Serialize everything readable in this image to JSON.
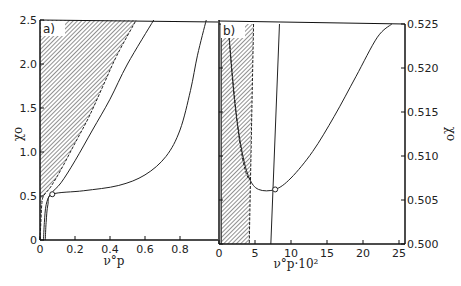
{
  "chart_data": [
    {
      "panel": "a)",
      "type": "line",
      "xlabel": "ν°p",
      "ylabel": "χo",
      "xlim": [
        0,
        1.0
      ],
      "ylim": [
        0,
        2.5
      ],
      "xticks": [
        0,
        0.2,
        0.4,
        0.6,
        0.8
      ],
      "xtick_labels": [
        "0",
        "0.2",
        "0.4",
        "0.6",
        "0.8"
      ],
      "yticks": [
        0,
        0.5,
        1.0,
        1.5,
        2.0,
        2.5
      ],
      "ytick_labels": [
        "0",
        "0.5",
        "1.0",
        "1.5",
        "2.0",
        "2.5"
      ],
      "grid": false,
      "shaded_region": {
        "description": "hatched region left of dashed boundary",
        "boundary": [
          [
            0.0,
            0.0
          ],
          [
            0.005,
            0.2
          ],
          [
            0.01,
            0.4
          ],
          [
            0.02,
            0.5
          ],
          [
            0.06,
            0.6
          ],
          [
            0.12,
            0.8
          ],
          [
            0.2,
            1.1
          ],
          [
            0.28,
            1.4
          ],
          [
            0.36,
            1.75
          ],
          [
            0.44,
            2.1
          ],
          [
            0.55,
            2.5
          ]
        ]
      },
      "series": [
        {
          "name": "curve 1",
          "style": "solid",
          "points": [
            [
              0.02,
              0.0
            ],
            [
              0.025,
              0.2
            ],
            [
              0.035,
              0.4
            ],
            [
              0.06,
              0.52
            ],
            [
              0.12,
              0.65
            ],
            [
              0.2,
              0.9
            ],
            [
              0.3,
              1.25
            ],
            [
              0.4,
              1.6
            ],
            [
              0.5,
              2.0
            ],
            [
              0.65,
              2.5
            ]
          ]
        },
        {
          "name": "curve 2",
          "style": "solid",
          "points": [
            [
              0.03,
              0.0
            ],
            [
              0.035,
              0.2
            ],
            [
              0.045,
              0.4
            ],
            [
              0.07,
              0.52
            ],
            [
              0.25,
              0.56
            ],
            [
              0.45,
              0.62
            ],
            [
              0.6,
              0.74
            ],
            [
              0.72,
              0.95
            ],
            [
              0.8,
              1.25
            ],
            [
              0.86,
              1.7
            ],
            [
              0.9,
              2.1
            ],
            [
              0.95,
              2.5
            ]
          ]
        }
      ],
      "markers": [
        {
          "x": 0.07,
          "y": 0.52,
          "shape": "open-circle"
        }
      ]
    },
    {
      "panel": "b)",
      "type": "line",
      "xlabel": "ν°p·10²",
      "ylabel": "χo",
      "xlim": [
        0,
        25
      ],
      "ylim": [
        0.5,
        0.525
      ],
      "xticks": [
        0,
        5,
        10,
        15,
        20,
        25
      ],
      "xtick_labels": [
        "0",
        "5",
        "10",
        "15",
        "20",
        "25"
      ],
      "yticks": [
        0.5,
        0.505,
        0.51,
        0.515,
        0.52,
        0.525
      ],
      "ytick_labels": [
        "0.500",
        "0.505",
        "0.510",
        "0.515",
        "0.520",
        "0.525"
      ],
      "y_axis_side": "right",
      "grid": false,
      "shaded_region": {
        "description": "hatched vertical band",
        "x_left": 0.3,
        "x_right_top": 4.8,
        "x_right_bottom": 4.2
      },
      "series": [
        {
          "name": "dashed boundary",
          "style": "dashed",
          "points": [
            [
              1.4,
              0.5235
            ],
            [
              2.0,
              0.518
            ],
            [
              2.8,
              0.512
            ],
            [
              3.6,
              0.5085
            ],
            [
              4.2,
              0.5073
            ]
          ]
        },
        {
          "name": "U curve",
          "style": "solid",
          "points": [
            [
              1.4,
              0.5235
            ],
            [
              2.2,
              0.516
            ],
            [
              3.2,
              0.5105
            ],
            [
              4.2,
              0.5075
            ],
            [
              5.5,
              0.5062
            ],
            [
              7.8,
              0.5062
            ],
            [
              10,
              0.5075
            ],
            [
              13,
              0.5105
            ],
            [
              16,
              0.5145
            ],
            [
              19,
              0.519
            ],
            [
              22,
              0.5235
            ],
            [
              24,
              0.525
            ]
          ]
        },
        {
          "name": "vertical line",
          "style": "solid",
          "points": [
            [
              7.2,
              0.5
            ],
            [
              8.4,
              0.525
            ]
          ]
        }
      ],
      "markers": [
        {
          "x": 7.8,
          "y": 0.5062,
          "shape": "open-circle"
        }
      ]
    }
  ]
}
